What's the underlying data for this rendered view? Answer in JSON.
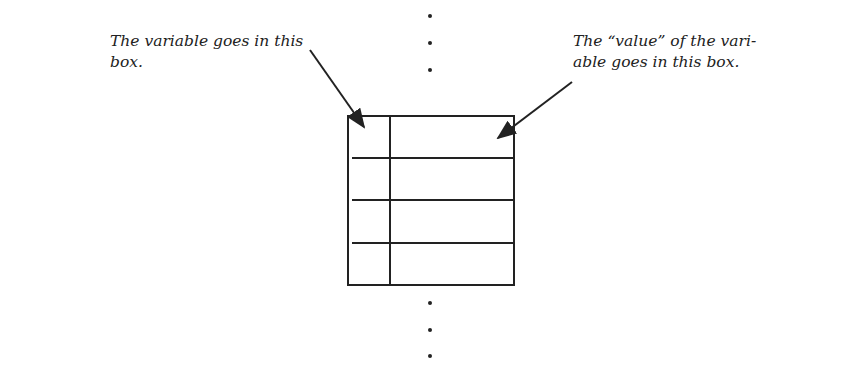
{
  "labels": {
    "left_line1": "The variable goes in this",
    "left_line2": "box.",
    "right_line1": "The “value” of the vari-",
    "right_line2": "able goes in this box."
  },
  "table": {
    "rows": 4,
    "columns": [
      "variable",
      "value"
    ]
  },
  "colors": {
    "ink": "#222222",
    "background": "#ffffff"
  }
}
